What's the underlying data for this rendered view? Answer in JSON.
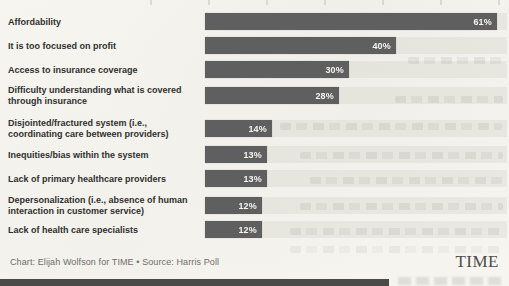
{
  "chart_data": {
    "type": "bar",
    "orientation": "horizontal",
    "title": "",
    "categories": [
      "Affordability",
      "It is too focused on profit",
      "Access to insurance coverage",
      "Difficulty understanding what is covered through insurance",
      "Disjointed/fractured system (i.e., coordinating care between providers)",
      "Inequities/bias within the system",
      "Lack of primary healthcare providers",
      "Depersonalization (i.e., absence of human interaction in customer service)",
      "Lack of health care specialists"
    ],
    "values": [
      61,
      40,
      30,
      28,
      14,
      13,
      13,
      12,
      12
    ],
    "value_suffix": "%",
    "xlim": [
      0,
      63.5
    ],
    "grid": false,
    "legend": false,
    "bar_color": "#5f5f5f",
    "value_label_color": "#ffffff"
  },
  "footer": {
    "credit": "Chart: Elijah Wolfson for TIME • Source: Harris Poll",
    "logo": "TIME"
  }
}
